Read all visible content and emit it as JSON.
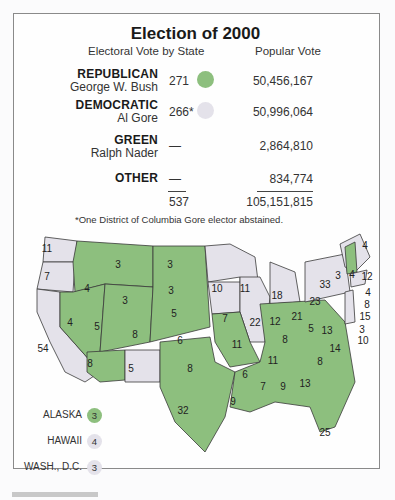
{
  "title": "Election of 2000",
  "headers": {
    "electoral": "Electoral Vote by State",
    "popular": "Popular Vote"
  },
  "colors": {
    "republican": "#8dbf7e",
    "democratic": "#e4e2ea",
    "border": "#3a3a3a"
  },
  "parties": [
    {
      "party": "REPUBLICAN",
      "candidate": "George W. Bush",
      "electoral": "271",
      "popular": "50,456,167",
      "color": "#8dbf7e"
    },
    {
      "party": "DEMOCRATIC",
      "candidate": "Al Gore",
      "electoral": "266*",
      "popular": "50,996,064",
      "color": "#e4e2ea"
    },
    {
      "party": "GREEN",
      "candidate": "Ralph Nader",
      "electoral": "—",
      "popular": "2,864,810"
    },
    {
      "party": "OTHER",
      "candidate": "",
      "electoral": "—",
      "popular": "834,774"
    }
  ],
  "totals": {
    "electoral": "537",
    "popular": "105,151,815"
  },
  "footnote": "*One District of Columbia Gore elector abstained.",
  "map_labels": [
    {
      "state": "WA",
      "votes": "11",
      "winner": "D"
    },
    {
      "state": "OR",
      "votes": "7",
      "winner": "D"
    },
    {
      "state": "CA",
      "votes": "54",
      "winner": "D"
    },
    {
      "state": "ID",
      "votes": "4",
      "winner": "R"
    },
    {
      "state": "NV",
      "votes": "4",
      "winner": "R"
    },
    {
      "state": "MT",
      "votes": "3",
      "winner": "R"
    },
    {
      "state": "WY",
      "votes": "3",
      "winner": "R"
    },
    {
      "state": "UT",
      "votes": "5",
      "winner": "R"
    },
    {
      "state": "CO",
      "votes": "8",
      "winner": "R"
    },
    {
      "state": "AZ",
      "votes": "8",
      "winner": "R"
    },
    {
      "state": "NM",
      "votes": "5",
      "winner": "D"
    },
    {
      "state": "ND",
      "votes": "3",
      "winner": "R"
    },
    {
      "state": "SD",
      "votes": "3",
      "winner": "R"
    },
    {
      "state": "NE",
      "votes": "5",
      "winner": "R"
    },
    {
      "state": "KS",
      "votes": "6",
      "winner": "R"
    },
    {
      "state": "OK",
      "votes": "8",
      "winner": "R"
    },
    {
      "state": "TX",
      "votes": "32",
      "winner": "R"
    },
    {
      "state": "MN",
      "votes": "10",
      "winner": "D"
    },
    {
      "state": "IA",
      "votes": "7",
      "winner": "D"
    },
    {
      "state": "MO",
      "votes": "11",
      "winner": "R"
    },
    {
      "state": "AR",
      "votes": "6",
      "winner": "R"
    },
    {
      "state": "LA",
      "votes": "9",
      "winner": "R"
    },
    {
      "state": "WI",
      "votes": "11",
      "winner": "D"
    },
    {
      "state": "IL",
      "votes": "22",
      "winner": "D"
    },
    {
      "state": "MI",
      "votes": "18",
      "winner": "D"
    },
    {
      "state": "IN",
      "votes": "12",
      "winner": "R"
    },
    {
      "state": "OH",
      "votes": "21",
      "winner": "R"
    },
    {
      "state": "KY",
      "votes": "8",
      "winner": "R"
    },
    {
      "state": "TN",
      "votes": "11",
      "winner": "R"
    },
    {
      "state": "MS",
      "votes": "7",
      "winner": "R"
    },
    {
      "state": "AL",
      "votes": "9",
      "winner": "R"
    },
    {
      "state": "GA",
      "votes": "13",
      "winner": "R"
    },
    {
      "state": "FL",
      "votes": "25",
      "winner": "R"
    },
    {
      "state": "SC",
      "votes": "8",
      "winner": "R"
    },
    {
      "state": "NC",
      "votes": "14",
      "winner": "R"
    },
    {
      "state": "VA",
      "votes": "13",
      "winner": "R"
    },
    {
      "state": "WV",
      "votes": "5",
      "winner": "R"
    },
    {
      "state": "PA",
      "votes": "23",
      "winner": "D"
    },
    {
      "state": "NY",
      "votes": "33",
      "winner": "D"
    },
    {
      "state": "VT",
      "votes": "3",
      "winner": "D"
    },
    {
      "state": "NH",
      "votes": "4",
      "winner": "R"
    },
    {
      "state": "ME",
      "votes": "4",
      "winner": "D"
    },
    {
      "state": "MA",
      "votes": "12",
      "winner": "D"
    },
    {
      "state": "RI",
      "votes": "4",
      "winner": "D"
    },
    {
      "state": "CT",
      "votes": "8",
      "winner": "D"
    },
    {
      "state": "NJ",
      "votes": "15",
      "winner": "D"
    },
    {
      "state": "DE",
      "votes": "3",
      "winner": "D"
    },
    {
      "state": "MD",
      "votes": "10",
      "winner": "D"
    }
  ],
  "legend": [
    {
      "label": "ALASKA",
      "votes": "3",
      "winner": "R"
    },
    {
      "label": "HAWAII",
      "votes": "4",
      "winner": "D"
    },
    {
      "label": "WASH., D.C.",
      "votes": "3",
      "winner": "D"
    }
  ]
}
